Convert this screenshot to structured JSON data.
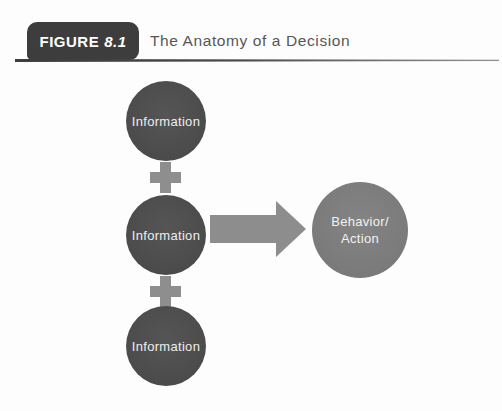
{
  "figure": {
    "badge_label": "FIGURE",
    "badge_number": "8.1",
    "title": "The Anatomy of a Decision"
  },
  "diagram": {
    "inputs": [
      {
        "label": "Information"
      },
      {
        "label": "Information"
      },
      {
        "label": "Information"
      }
    ],
    "plus_icons": [
      {
        "symbol": "+"
      },
      {
        "symbol": "+"
      }
    ],
    "arrow_icon": "arrow-right",
    "result": {
      "lines": [
        "Behavior/",
        "Action"
      ]
    }
  },
  "colors": {
    "badge_bg": "#3d3d3d",
    "title_text": "#575757",
    "rule_dark": "#3c3c3c",
    "rule_light": "#8f8f8f",
    "input_circle_bg": "#4c4c4c",
    "result_circle_bg": "#7b7b7b",
    "connector_gray": "#8e8e8e",
    "circle_text": "#eeeeee"
  }
}
